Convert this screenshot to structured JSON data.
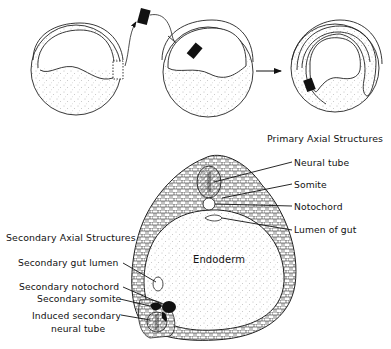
{
  "figure": {
    "type": "embryology-diagram",
    "top_row": {
      "stages": [
        {
          "id": "donor-embryo",
          "description": "Gastrula with dorsal lip region excised"
        },
        {
          "id": "host-embryo",
          "description": "Host gastrula receiving transplanted dorsal lip"
        },
        {
          "id": "result-embryo",
          "description": "Host embryo with transplant invaginated"
        }
      ],
      "arrow": "right-arrow"
    },
    "cross_section": {
      "center_label": "Endoderm",
      "primary": {
        "title": "Primary Axial Structures",
        "labels": [
          "Neural tube",
          "Somite",
          "Notochord",
          "Lumen of gut"
        ]
      },
      "secondary": {
        "title": "Secondary Axial Structures",
        "labels": [
          "Secondary gut lumen",
          "Secondary notochord",
          "Secondary somite",
          "Induced secondary",
          "neural tube"
        ]
      }
    },
    "colors": {
      "ink": "#111111",
      "background": "#ffffff",
      "stipple": "#8a8a8a"
    }
  }
}
